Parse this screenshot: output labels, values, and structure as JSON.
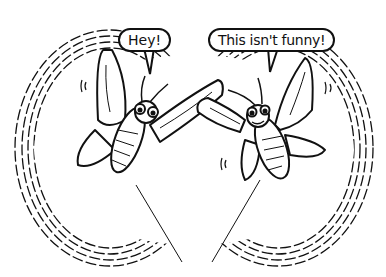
{
  "illustration": {
    "style": "black-and-white ink cartoon",
    "colors": {
      "ink": "#111111",
      "background": "#ffffff"
    },
    "speech_bubbles": [
      {
        "speaker": "left-insect",
        "text": "Hey!"
      },
      {
        "speaker": "right-insect",
        "text": "This isn't funny!"
      }
    ],
    "subjects": [
      {
        "name": "left-insect",
        "description": "winged insect tethered by a string, startled expression"
      },
      {
        "name": "right-insect",
        "description": "winged insect tethered by a string, grimacing expression"
      }
    ],
    "frame": "oval of hatched motion strokes"
  }
}
